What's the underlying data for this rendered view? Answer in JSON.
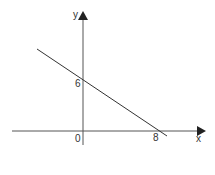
{
  "diagram": {
    "type": "coordinate-graph",
    "axes": {
      "x_label": "x",
      "y_label": "y",
      "origin_label": "0"
    },
    "line": {
      "y_intercept": 6,
      "x_intercept": 8,
      "y_intercept_label": "6",
      "x_intercept_label": "8"
    },
    "colors": {
      "ink": "#333333",
      "background": "#ffffff"
    }
  }
}
